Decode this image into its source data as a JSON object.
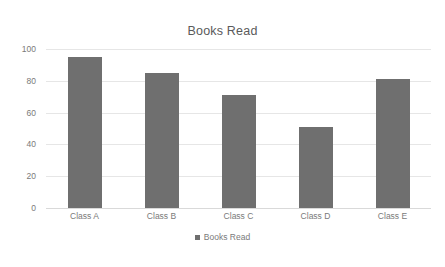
{
  "chart_data": {
    "type": "bar",
    "title": "Books Read",
    "xlabel": "",
    "ylabel": "",
    "categories": [
      "Class A",
      "Class B",
      "Class C",
      "Class D",
      "Class E"
    ],
    "values": [
      95,
      85,
      71,
      51,
      81
    ],
    "series": [
      {
        "name": "Books Read",
        "values": [
          95,
          85,
          71,
          51,
          81
        ],
        "color": "#6f6f6f"
      }
    ],
    "ylim": [
      0,
      100
    ],
    "y_ticks": [
      0,
      20,
      40,
      60,
      80,
      100
    ],
    "y_tick_labels": [
      "0",
      "20",
      "40",
      "60",
      "80",
      "100"
    ],
    "grid": true,
    "grid_axis": "y",
    "legend": {
      "position": "bottom",
      "entries": [
        {
          "label": "Books Read",
          "marker": "square-marker",
          "color": "#6f6f6f"
        }
      ]
    },
    "colors": {
      "bar": "#6f6f6f",
      "grid": "#e6e6e6",
      "text": "#7a7a7a",
      "title_text": "#5a5a5a",
      "background": "#ffffff"
    }
  }
}
